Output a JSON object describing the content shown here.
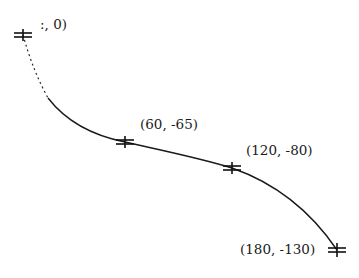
{
  "diagram": {
    "type": "curve-through-points",
    "stroke_color": "#1a1a1a",
    "background": "#ffffff",
    "points": [
      {
        "label": ":, 0)",
        "full_label": "(0, 0)",
        "x": 0,
        "y": 0,
        "px": 23,
        "py": 35
      },
      {
        "label": "(60, -65)",
        "x": 60,
        "y": -65,
        "px": 125,
        "py": 142
      },
      {
        "label": "(120, -80)",
        "x": 120,
        "y": -80,
        "px": 232,
        "py": 168
      },
      {
        "label": "(180, -130)",
        "x": 180,
        "y": -130,
        "px": 337,
        "py": 250
      }
    ],
    "marker": "asterisk-tick"
  }
}
